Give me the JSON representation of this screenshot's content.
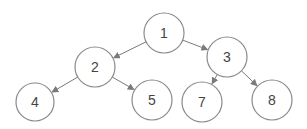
{
  "diagram": {
    "type": "binary-tree",
    "colors": {
      "node_fill": "#ffffff",
      "node_stroke": "#8a8a8a",
      "edge": "#7a7a7a",
      "label": "#444444"
    },
    "nodes": [
      {
        "id": "1",
        "label": "1",
        "cx": 164,
        "cy": 33,
        "r": 20
      },
      {
        "id": "2",
        "label": "2",
        "cx": 95,
        "cy": 67,
        "r": 20
      },
      {
        "id": "3",
        "label": "3",
        "cx": 227,
        "cy": 57,
        "r": 20
      },
      {
        "id": "4",
        "label": "4",
        "cx": 35,
        "cy": 102,
        "r": 19
      },
      {
        "id": "5",
        "label": "5",
        "cx": 152,
        "cy": 100,
        "r": 20
      },
      {
        "id": "7",
        "label": "7",
        "cx": 202,
        "cy": 102,
        "r": 20
      },
      {
        "id": "8",
        "label": "8",
        "cx": 272,
        "cy": 100,
        "r": 20
      }
    ],
    "edges": [
      {
        "from": "1",
        "to": "2"
      },
      {
        "from": "1",
        "to": "3"
      },
      {
        "from": "2",
        "to": "4"
      },
      {
        "from": "2",
        "to": "5"
      },
      {
        "from": "3",
        "to": "7"
      },
      {
        "from": "3",
        "to": "8"
      }
    ]
  }
}
